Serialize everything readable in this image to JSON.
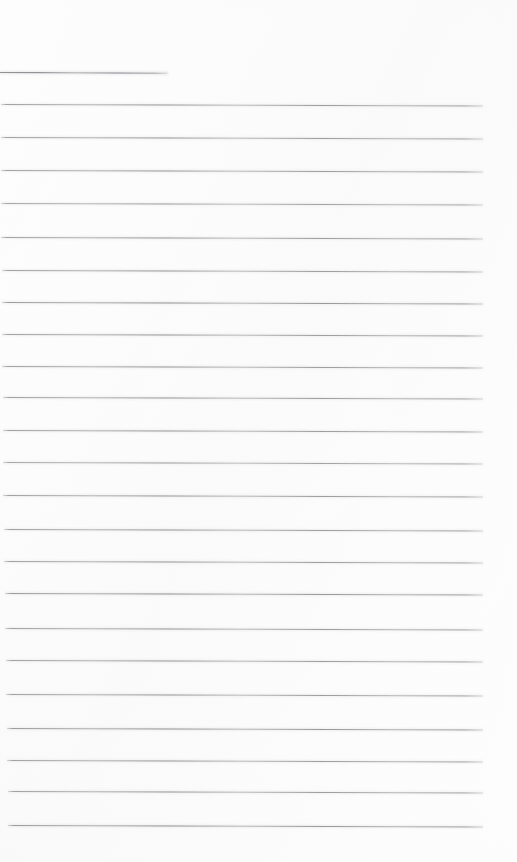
{
  "document": {
    "kind": "scanned-ruled-paper",
    "title": "",
    "body_text": "",
    "background_color": "#fefefe",
    "rule_color": "#8c8c90",
    "page_width": 517,
    "page_height": 862,
    "total_rules": 24,
    "filled_in": false
  },
  "layout": {
    "left_margin_px": 0,
    "right_edge_px": 483,
    "top_margin_px": 72,
    "bottom_margin_px": 37,
    "line_spacing_px": 32,
    "rule_thickness_px": 1,
    "page_skew_deg": 0.18
  },
  "rules": [
    {
      "index": 1,
      "name": "title-rule",
      "y": 72,
      "x": 0,
      "width": 168,
      "skew": 0.22,
      "weight": 1.0
    },
    {
      "index": 2,
      "name": "writing-rule-01",
      "y": 104,
      "x": 1,
      "width": 482,
      "skew": 0.18,
      "weight": 0.9
    },
    {
      "index": 3,
      "name": "writing-rule-02",
      "y": 137,
      "x": 1,
      "width": 482,
      "skew": 0.18,
      "weight": 0.9
    },
    {
      "index": 4,
      "name": "writing-rule-03",
      "y": 170,
      "x": 1,
      "width": 482,
      "skew": 0.18,
      "weight": 0.9
    },
    {
      "index": 5,
      "name": "writing-rule-04",
      "y": 203,
      "x": 1,
      "width": 482,
      "skew": 0.18,
      "weight": 0.85
    },
    {
      "index": 6,
      "name": "writing-rule-05",
      "y": 237,
      "x": 1,
      "width": 482,
      "skew": 0.18,
      "weight": 0.9
    },
    {
      "index": 7,
      "name": "writing-rule-06",
      "y": 270,
      "x": 2,
      "width": 481,
      "skew": 0.18,
      "weight": 0.9
    },
    {
      "index": 8,
      "name": "writing-rule-07",
      "y": 302,
      "x": 2,
      "width": 481,
      "skew": 0.18,
      "weight": 0.95
    },
    {
      "index": 9,
      "name": "writing-rule-08",
      "y": 334,
      "x": 2,
      "width": 481,
      "skew": 0.18,
      "weight": 0.9
    },
    {
      "index": 10,
      "name": "writing-rule-09",
      "y": 366,
      "x": 2,
      "width": 481,
      "skew": 0.18,
      "weight": 0.9
    },
    {
      "index": 11,
      "name": "writing-rule-10",
      "y": 397,
      "x": 3,
      "width": 480,
      "skew": 0.18,
      "weight": 0.9
    },
    {
      "index": 12,
      "name": "writing-rule-11",
      "y": 430,
      "x": 3,
      "width": 480,
      "skew": 0.18,
      "weight": 0.9
    },
    {
      "index": 13,
      "name": "writing-rule-12",
      "y": 462,
      "x": 3,
      "width": 480,
      "skew": 0.18,
      "weight": 0.85
    },
    {
      "index": 14,
      "name": "writing-rule-13",
      "y": 495,
      "x": 3,
      "width": 480,
      "skew": 0.18,
      "weight": 0.9
    },
    {
      "index": 15,
      "name": "writing-rule-14",
      "y": 529,
      "x": 4,
      "width": 479,
      "skew": 0.18,
      "weight": 0.9
    },
    {
      "index": 16,
      "name": "writing-rule-15",
      "y": 561,
      "x": 4,
      "width": 479,
      "skew": 0.18,
      "weight": 0.9
    },
    {
      "index": 17,
      "name": "writing-rule-16",
      "y": 593,
      "x": 5,
      "width": 478,
      "skew": 0.18,
      "weight": 0.95
    },
    {
      "index": 18,
      "name": "writing-rule-17",
      "y": 628,
      "x": 5,
      "width": 478,
      "skew": 0.18,
      "weight": 0.9
    },
    {
      "index": 19,
      "name": "writing-rule-18",
      "y": 660,
      "x": 6,
      "width": 477,
      "skew": 0.18,
      "weight": 0.9
    },
    {
      "index": 20,
      "name": "writing-rule-19",
      "y": 694,
      "x": 6,
      "width": 477,
      "skew": 0.18,
      "weight": 0.9
    },
    {
      "index": 21,
      "name": "writing-rule-20",
      "y": 728,
      "x": 7,
      "width": 476,
      "skew": 0.18,
      "weight": 0.95
    },
    {
      "index": 22,
      "name": "writing-rule-21",
      "y": 760,
      "x": 7,
      "width": 476,
      "skew": 0.18,
      "weight": 0.9
    },
    {
      "index": 23,
      "name": "writing-rule-22",
      "y": 791,
      "x": 8,
      "width": 475,
      "skew": 0.18,
      "weight": 0.9
    },
    {
      "index": 24,
      "name": "writing-rule-23",
      "y": 825,
      "x": 8,
      "width": 475,
      "skew": 0.18,
      "weight": 0.95
    }
  ]
}
